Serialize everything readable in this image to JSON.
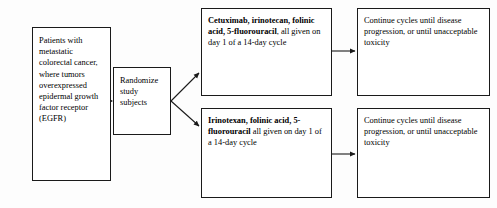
{
  "diagram": {
    "nodes": {
      "population": {
        "text": "Patients with metastatic colorectal cancer, where tumors overexpressed epidermal growth factor receptor (EGFR)"
      },
      "randomize": {
        "text": "Randomize study subjects"
      },
      "arm_a": {
        "drug_1": "Cetuximab",
        "sep_1": ",",
        "drug_2": "irinotecan",
        "sep_2": ",",
        "drug_3": "folinic acid",
        "sep_3": ",",
        "drug_4": "5-fluorouracil",
        "tail": ", all given on day 1 of a 14-day cycle"
      },
      "arm_b": {
        "drug_1": "Irinotexan",
        "sep_1": ",",
        "drug_2": "folinic acid",
        "sep_2": ",",
        "drug_3": "5-fluorouracil",
        "tail": " all given on day 1 of a 14-day cycle"
      },
      "outcome_a": {
        "text": "Continue cycles until disease progression, or until unacceptable toxicity"
      },
      "outcome_b": {
        "text": "Continue cycles until disease progression, or until unacceptable toxicity"
      }
    },
    "edges": [
      {
        "name": "population-to-randomize",
        "from": "population",
        "to": "randomize"
      },
      {
        "name": "randomize-to-arm-a",
        "from": "randomize",
        "to": "arm_a"
      },
      {
        "name": "randomize-to-arm-b",
        "from": "randomize",
        "to": "arm_b"
      },
      {
        "name": "arm-a-to-outcome-a",
        "from": "arm_a",
        "to": "outcome_a"
      },
      {
        "name": "arm-b-to-outcome-b",
        "from": "arm_b",
        "to": "outcome_b"
      }
    ],
    "colors": {
      "stroke": "#1a1a1a",
      "box_fill": "#ffffff",
      "background": "#fdfdfd",
      "text": "#000000"
    }
  }
}
